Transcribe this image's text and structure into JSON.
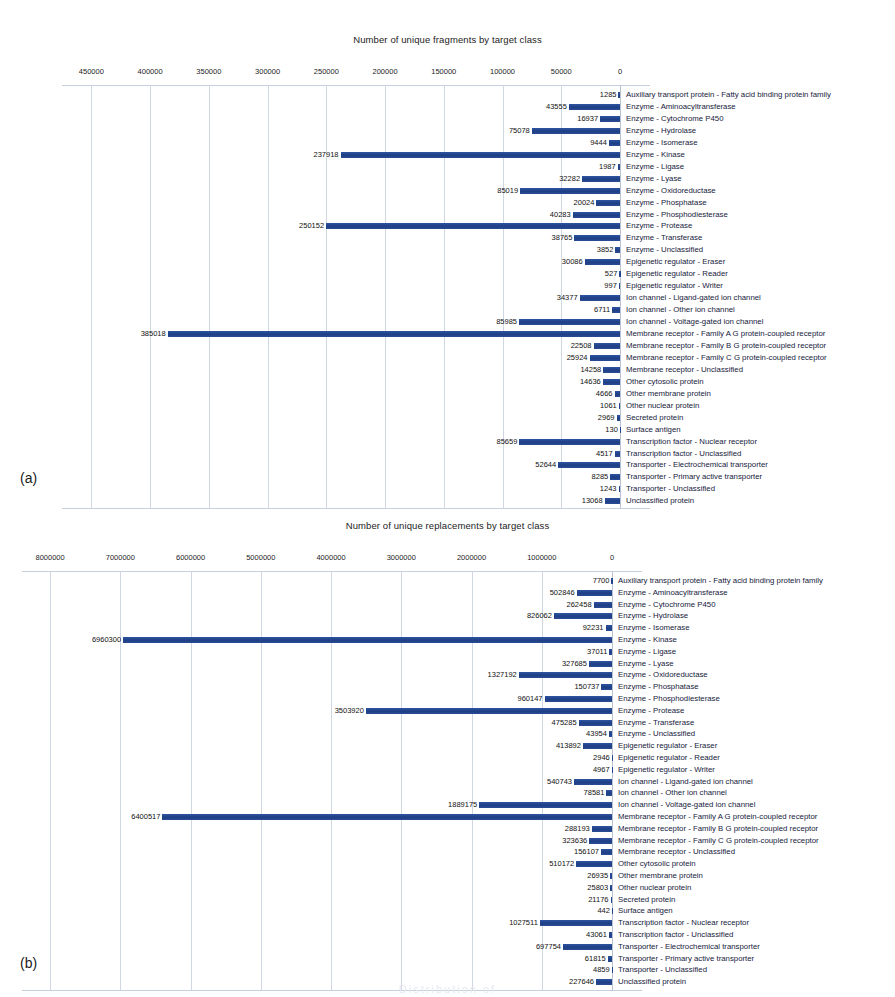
{
  "page": {
    "panel_a_label": "(a)",
    "panel_b_label": "(b)",
    "footer_partial": "Distribution of"
  },
  "chart_data": [
    {
      "id": "a",
      "type": "bar",
      "orientation": "horizontal",
      "title": "Number of unique fragments by target class",
      "xlabel": "",
      "ylabel": "",
      "axis_reversed": true,
      "grid": true,
      "legend": "none",
      "xlim": [
        0,
        475000
      ],
      "xticks": [
        450000,
        400000,
        350000,
        300000,
        250000,
        200000,
        150000,
        100000,
        50000,
        0
      ],
      "xtick_labels": [
        "450000",
        "400000",
        "350000",
        "300000",
        "250000",
        "200000",
        "150000",
        "100000",
        "50000",
        "0"
      ],
      "categories": [
        "Auxiliary transport protein  -  Fatty acid binding protein family",
        "Enzyme  -  Aminoacyltransferase",
        "Enzyme  -  Cytochrome P450",
        "Enzyme  -  Hydrolase",
        "Enzyme  -  Isomerase",
        "Enzyme  -  Kinase",
        "Enzyme  -  Ligase",
        "Enzyme  -  Lyase",
        "Enzyme  -  Oxidoreductase",
        "Enzyme  -  Phosphatase",
        "Enzyme  -  Phosphodiesterase",
        "Enzyme  -  Protease",
        "Enzyme  -  Transferase",
        "Enzyme  -  Unclassified",
        "Epigenetic regulator  -  Eraser",
        "Epigenetic regulator  -  Reader",
        "Epigenetic regulator  -  Writer",
        "Ion channel  -  Ligand-gated ion channel",
        "Ion channel  -  Other ion channel",
        "Ion channel  -  Voltage-gated ion channel",
        "Membrane receptor  -  Family A G protein-coupled receptor",
        "Membrane receptor  -  Family B G protein-coupled receptor",
        "Membrane receptor  -  Family C G protein-coupled receptor",
        "Membrane receptor  -  Unclassified",
        "Other cytosolic protein",
        "Other membrane protein",
        "Other nuclear protein",
        "Secreted protein",
        "Surface antigen",
        "Transcription factor  -  Nuclear receptor",
        "Transcription factor  -  Unclassified",
        "Transporter  -  Electrochemical transporter",
        "Transporter  -  Primary active transporter",
        "Transporter  -  Unclassified",
        "Unclassified protein"
      ],
      "values": [
        1285,
        43555,
        16937,
        75078,
        9444,
        237918,
        1987,
        32282,
        85019,
        20024,
        40283,
        250152,
        38765,
        3852,
        30086,
        527,
        997,
        34377,
        6711,
        85985,
        385018,
        22508,
        25924,
        14258,
        14636,
        4666,
        1061,
        2969,
        130,
        85659,
        4517,
        52644,
        8285,
        1243,
        13068
      ]
    },
    {
      "id": "b",
      "type": "bar",
      "orientation": "horizontal",
      "title": "Number of unique replacements by target class",
      "xlabel": "",
      "ylabel": "",
      "axis_reversed": true,
      "grid": true,
      "legend": "none",
      "xlim": [
        0,
        8400000
      ],
      "xticks": [
        8000000,
        7000000,
        6000000,
        5000000,
        4000000,
        3000000,
        2000000,
        1000000,
        0
      ],
      "xtick_labels": [
        "8000000",
        "7000000",
        "6000000",
        "5000000",
        "4000000",
        "3000000",
        "2000000",
        "1000000",
        "0"
      ],
      "categories": [
        "Auxiliary transport protein  -  Fatty acid binding protein family",
        "Enzyme  -  Aminoacyltransferase",
        "Enzyme  -  Cytochrome P450",
        "Enzyme  -  Hydrolase",
        "Enzyme  -  Isomerase",
        "Enzyme  -  Kinase",
        "Enzyme  -  Ligase",
        "Enzyme  -  Lyase",
        "Enzyme  -  Oxidoreductase",
        "Enzyme  -  Phosphatase",
        "Enzyme  -  Phosphodiesterase",
        "Enzyme  -  Protease",
        "Enzyme  -  Transferase",
        "Enzyme  -  Unclassified",
        "Epigenetic regulator  -  Eraser",
        "Epigenetic regulator  -  Reader",
        "Epigenetic regulator  -  Writer",
        "Ion channel  -  Ligand-gated ion channel",
        "Ion channel  -  Other ion channel",
        "Ion channel  -  Voltage-gated ion channel",
        "Membrane receptor  -  Family A G protein-coupled receptor",
        "Membrane receptor  -  Family B G protein-coupled receptor",
        "Membrane receptor  -  Family C G protein-coupled receptor",
        "Membrane receptor  -  Unclassified",
        "Other cytosolic protein",
        "Other membrane protein",
        "Other nuclear protein",
        "Secreted protein",
        "Surface antigen",
        "Transcription factor  -  Nuclear receptor",
        "Transcription factor  -  Unclassified",
        "Transporter  -  Electrochemical transporter",
        "Transporter  -  Primary active transporter",
        "Transporter  -  Unclassified",
        "Unclassified protein"
      ],
      "values": [
        7700,
        502846,
        262458,
        826062,
        92231,
        6960300,
        37011,
        327685,
        1327192,
        150737,
        960147,
        3503920,
        475285,
        43954,
        413892,
        2946,
        4967,
        540743,
        78581,
        1889175,
        6400517,
        288193,
        323636,
        156107,
        510172,
        26935,
        25803,
        21176,
        442,
        1027511,
        43061,
        697754,
        61815,
        4859,
        227646
      ]
    }
  ],
  "colors": {
    "bar": "#23478f",
    "grid": "#cfd7e3",
    "text": "#1a1a1a"
  }
}
